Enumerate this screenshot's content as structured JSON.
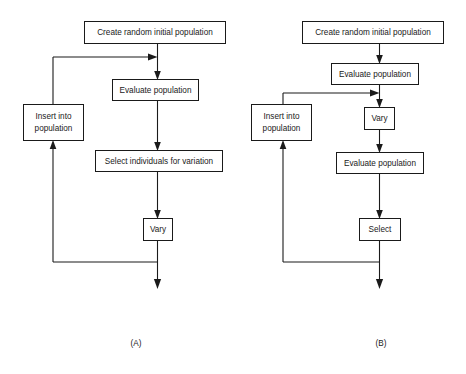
{
  "figure": {
    "background_color": "#ffffff",
    "line_color": "#1a1a1a",
    "box_fill": "#ffffff",
    "panels": [
      {
        "id": "A",
        "caption": "(A)",
        "caption_x": 136,
        "caption_y": 344,
        "nodes": [
          {
            "key": "create",
            "label": "Create random initial population",
            "x": 84,
            "y": 21,
            "w": 142,
            "h": 23
          },
          {
            "key": "evaluate",
            "label": "Evaluate population",
            "x": 112,
            "y": 79,
            "w": 87,
            "h": 22
          },
          {
            "key": "insert",
            "label_line1": "Insert into",
            "label_line2": "population",
            "x": 23,
            "y": 104,
            "w": 61,
            "h": 37
          },
          {
            "key": "select",
            "label": "Select individuals for variation",
            "x": 95,
            "y": 150,
            "w": 128,
            "h": 22
          },
          {
            "key": "vary",
            "label": "Vary",
            "x": 143,
            "y": 218,
            "w": 30,
            "h": 23
          }
        ]
      },
      {
        "id": "B",
        "caption": "(B)",
        "caption_x": 381,
        "caption_y": 344,
        "nodes": [
          {
            "key": "create",
            "label": "Create random initial population",
            "x": 302,
            "y": 21,
            "w": 142,
            "h": 23
          },
          {
            "key": "evaluate1",
            "label": "Evaluate population",
            "x": 331,
            "y": 63,
            "w": 88,
            "h": 22
          },
          {
            "key": "insert",
            "label_line1": "Insert into",
            "label_line2": "population",
            "x": 251,
            "y": 104,
            "w": 61,
            "h": 37
          },
          {
            "key": "vary",
            "label": "Vary",
            "x": 364,
            "y": 107,
            "w": 31,
            "h": 23
          },
          {
            "key": "evaluate2",
            "label": "Evaluate population",
            "x": 336,
            "y": 152,
            "w": 88,
            "h": 22
          },
          {
            "key": "select",
            "label": "Select",
            "x": 359,
            "y": 218,
            "w": 42,
            "h": 23
          }
        ]
      }
    ]
  }
}
